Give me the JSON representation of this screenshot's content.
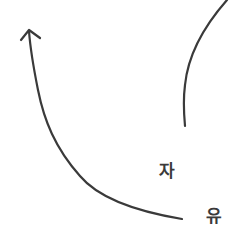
{
  "diagram": {
    "labels": {
      "first": "자",
      "second": "유"
    },
    "colors": {
      "stroke": "#3a3a3a",
      "background": "#ffffff"
    },
    "elements": [
      {
        "type": "curved-arrow",
        "from": "bottom-right",
        "to": "top-left",
        "head": "arrow"
      },
      {
        "type": "curve",
        "from": "top-right",
        "to": "middle-right"
      }
    ]
  }
}
